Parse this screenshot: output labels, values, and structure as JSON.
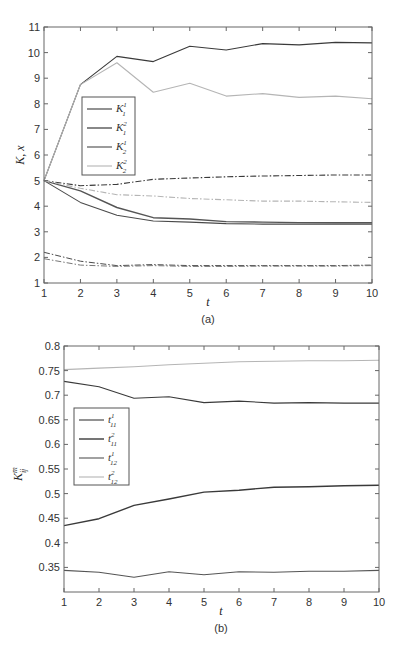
{
  "chart_data": [
    {
      "id": "a",
      "type": "line",
      "caption": "(a)",
      "title": "",
      "xlabel": "t",
      "ylabel": "K, x",
      "xlim": [
        1,
        10
      ],
      "ylim": [
        1,
        11
      ],
      "x_ticks": [
        "1",
        "2",
        "3",
        "4",
        "5",
        "6",
        "7",
        "8",
        "9",
        "10"
      ],
      "y_ticks": [
        "1",
        "2",
        "3",
        "4",
        "5",
        "6",
        "7",
        "8",
        "9",
        "10",
        "11"
      ],
      "grid": false,
      "legend_position": "upper-left-inset",
      "x": [
        1,
        2,
        3,
        4,
        5,
        6,
        7,
        8,
        9,
        10
      ],
      "series": [
        {
          "name": "K_1^1",
          "label_base": "K",
          "sub": "1",
          "sup": "1",
          "style": "solid",
          "color": "#3a3a3a",
          "width": 1.1,
          "in_legend": true,
          "values": [
            5,
            8.75,
            9.85,
            9.65,
            10.25,
            10.1,
            10.35,
            10.3,
            10.4,
            10.38
          ]
        },
        {
          "name": "K_1^2",
          "label_base": "K",
          "sub": "1",
          "sup": "2",
          "style": "solid",
          "color": "#555555",
          "width": 1.4,
          "in_legend": true,
          "values": [
            5,
            4.6,
            3.95,
            3.55,
            3.5,
            3.4,
            3.38,
            3.36,
            3.35,
            3.35
          ]
        },
        {
          "name": "K_2^1",
          "label_base": "K",
          "sub": "2",
          "sup": "1",
          "style": "solid",
          "color": "#4a4a4a",
          "width": 1.1,
          "in_legend": true,
          "values": [
            5,
            4.15,
            3.65,
            3.42,
            3.38,
            3.32,
            3.3,
            3.3,
            3.3,
            3.3
          ]
        },
        {
          "name": "K_2^2",
          "label_base": "K",
          "sub": "2",
          "sup": "2",
          "style": "solid",
          "color": "#b5b5b5",
          "width": 1.1,
          "in_legend": true,
          "values": [
            5,
            8.75,
            9.6,
            8.45,
            8.8,
            8.3,
            8.4,
            8.25,
            8.3,
            8.2
          ]
        },
        {
          "name": "x_dashdot_dark_upper",
          "style": "dashdot",
          "color": "#3a3a3a",
          "width": 1.1,
          "in_legend": false,
          "values": [
            5,
            4.8,
            4.85,
            5.05,
            5.1,
            5.15,
            5.18,
            5.2,
            5.22,
            5.22
          ]
        },
        {
          "name": "x_dashdot_light_upper",
          "style": "dashdot",
          "color": "#b5b5b5",
          "width": 1.1,
          "in_legend": false,
          "values": [
            5,
            4.7,
            4.45,
            4.4,
            4.3,
            4.25,
            4.2,
            4.2,
            4.17,
            4.15
          ]
        },
        {
          "name": "x_dashdot_lower_1",
          "style": "dashdot",
          "color": "#4a4a4a",
          "width": 1.0,
          "in_legend": false,
          "values": [
            2.2,
            1.85,
            1.68,
            1.72,
            1.68,
            1.68,
            1.68,
            1.68,
            1.68,
            1.7
          ]
        },
        {
          "name": "x_dashdot_lower_2",
          "style": "dashdot",
          "color": "#777777",
          "width": 1.0,
          "in_legend": false,
          "values": [
            1.95,
            1.7,
            1.65,
            1.68,
            1.65,
            1.65,
            1.66,
            1.66,
            1.66,
            1.68
          ]
        }
      ]
    },
    {
      "id": "b",
      "type": "line",
      "caption": "(b)",
      "title": "",
      "xlabel": "t",
      "ylabel": "K_ij^m",
      "xlim": [
        1,
        10
      ],
      "ylim": [
        0.3,
        0.8
      ],
      "x_ticks": [
        "1",
        "2",
        "3",
        "4",
        "5",
        "6",
        "7",
        "8",
        "9",
        "10"
      ],
      "y_ticks": [
        "0.35",
        "0.4",
        "0.45",
        "0.5",
        "0.55",
        "0.6",
        "0.65",
        "0.7",
        "0.75",
        "0.8"
      ],
      "grid": false,
      "legend_position": "middle-left-inset",
      "x": [
        1,
        2,
        3,
        4,
        5,
        6,
        7,
        8,
        9,
        10
      ],
      "series": [
        {
          "name": "t_11^1",
          "label_base": "t",
          "sub": "11",
          "sup": "1",
          "style": "solid",
          "color": "#3a3a3a",
          "width": 1.1,
          "in_legend": true,
          "values": [
            0.728,
            0.717,
            0.694,
            0.697,
            0.685,
            0.688,
            0.684,
            0.685,
            0.684,
            0.684
          ]
        },
        {
          "name": "t_11^2",
          "label_base": "t",
          "sub": "11",
          "sup": "2",
          "style": "solid",
          "color": "#3a3a3a",
          "width": 1.4,
          "in_legend": true,
          "values": [
            0.435,
            0.449,
            0.476,
            0.489,
            0.503,
            0.507,
            0.513,
            0.514,
            0.516,
            0.517
          ]
        },
        {
          "name": "t_12^1",
          "label_base": "t",
          "sub": "12",
          "sup": "1",
          "style": "solid",
          "color": "#555555",
          "width": 1.1,
          "in_legend": true,
          "values": [
            0.344,
            0.34,
            0.33,
            0.341,
            0.335,
            0.341,
            0.34,
            0.342,
            0.342,
            0.344
          ]
        },
        {
          "name": "t_12^2",
          "label_base": "t",
          "sub": "12",
          "sup": "2",
          "style": "solid",
          "color": "#b5b5b5",
          "width": 1.1,
          "in_legend": true,
          "values": [
            0.752,
            0.755,
            0.758,
            0.762,
            0.765,
            0.768,
            0.769,
            0.77,
            0.77,
            0.771
          ]
        }
      ]
    }
  ],
  "figure": {
    "panel_a": {
      "caption": "(a)",
      "xlabel": "t",
      "ylabel": "K, x",
      "legend": [
        {
          "base": "K",
          "sub": "1",
          "sup": "1"
        },
        {
          "base": "K",
          "sub": "1",
          "sup": "2"
        },
        {
          "base": "K",
          "sub": "2",
          "sup": "1"
        },
        {
          "base": "K",
          "sub": "2",
          "sup": "2"
        }
      ]
    },
    "panel_b": {
      "caption": "(b)",
      "xlabel": "t",
      "ylabel_base": "K",
      "ylabel_sup": "m",
      "ylabel_sub": "ij",
      "legend": [
        {
          "base": "t",
          "sub": "11",
          "sup": "1"
        },
        {
          "base": "t",
          "sub": "11",
          "sup": "2"
        },
        {
          "base": "t",
          "sub": "12",
          "sup": "1"
        },
        {
          "base": "t",
          "sub": "12",
          "sup": "2"
        }
      ]
    }
  }
}
